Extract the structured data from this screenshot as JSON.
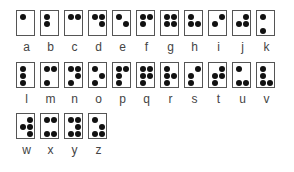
{
  "colors": {
    "dot": "#111111",
    "border": "#555555",
    "label": "#444444",
    "background": "#ffffff"
  },
  "rows": [
    [
      {
        "letter": "a",
        "dots": [
          1
        ]
      },
      {
        "letter": "b",
        "dots": [
          1,
          2
        ]
      },
      {
        "letter": "c",
        "dots": [
          1,
          4
        ]
      },
      {
        "letter": "d",
        "dots": [
          1,
          4,
          5
        ]
      },
      {
        "letter": "e",
        "dots": [
          1,
          5
        ]
      },
      {
        "letter": "f",
        "dots": [
          1,
          2,
          4
        ]
      },
      {
        "letter": "g",
        "dots": [
          1,
          2,
          4,
          5
        ]
      },
      {
        "letter": "h",
        "dots": [
          1,
          2,
          5
        ]
      },
      {
        "letter": "i",
        "dots": [
          2,
          4
        ]
      },
      {
        "letter": "j",
        "dots": [
          2,
          4,
          5
        ]
      },
      {
        "letter": "k",
        "dots": [
          1,
          3
        ]
      }
    ],
    [
      {
        "letter": "l",
        "dots": [
          1,
          2,
          3
        ]
      },
      {
        "letter": "m",
        "dots": [
          1,
          3,
          4
        ]
      },
      {
        "letter": "n",
        "dots": [
          1,
          3,
          4,
          5
        ]
      },
      {
        "letter": "o",
        "dots": [
          1,
          3,
          5
        ]
      },
      {
        "letter": "p",
        "dots": [
          1,
          2,
          3,
          4
        ]
      },
      {
        "letter": "q",
        "dots": [
          1,
          2,
          3,
          4,
          5
        ]
      },
      {
        "letter": "r",
        "dots": [
          1,
          2,
          3,
          5
        ]
      },
      {
        "letter": "s",
        "dots": [
          2,
          3,
          4
        ]
      },
      {
        "letter": "t",
        "dots": [
          2,
          3,
          4,
          5
        ]
      },
      {
        "letter": "u",
        "dots": [
          1,
          3,
          6
        ]
      },
      {
        "letter": "v",
        "dots": [
          1,
          2,
          3,
          6
        ]
      }
    ],
    [
      {
        "letter": "w",
        "dots": [
          2,
          4,
          5,
          6
        ]
      },
      {
        "letter": "x",
        "dots": [
          1,
          3,
          4,
          6
        ]
      },
      {
        "letter": "y",
        "dots": [
          1,
          3,
          4,
          5,
          6
        ]
      },
      {
        "letter": "z",
        "dots": [
          1,
          3,
          5,
          6
        ]
      }
    ]
  ]
}
